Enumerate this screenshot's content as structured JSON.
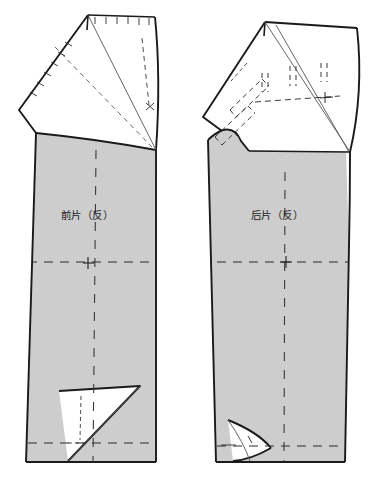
{
  "document": {
    "type": "garment-pattern-draft",
    "title": "",
    "background_color": "#ffffff",
    "canvas": {
      "width": 392,
      "height": 496
    }
  },
  "style": {
    "cut_line_color": "#1a1a1a",
    "fabric_fill": "#cdcdcd",
    "fold_fill": "#ffffff",
    "construction_line_color": "#3a3a3a",
    "thin_line_color": "#555555",
    "cut_line_width": 1.8,
    "thin_line_width": 0.8,
    "dash_pattern": "5,3",
    "short_dash_pattern": "3,2.5"
  },
  "pieces": [
    {
      "id": "front",
      "name": "front-pattern-piece",
      "label": "前片（反）",
      "label_x": 87,
      "label_y": 215,
      "description": "Trouser front panel, wrong side, with rotated top flap and bottom hem flap"
    },
    {
      "id": "back",
      "name": "back-pattern-piece",
      "label": "后片（反）",
      "label_x": 276,
      "label_y": 215,
      "description": "Trouser back panel, wrong side, with rotated top flap, pocket markings and bottom hem flap"
    }
  ],
  "markings": {
    "notch_label": "notch-tick",
    "grain_label": "grain-dash-line",
    "knee_label": "knee-cross-marker",
    "fold_label": "fold-flap",
    "pocket_label": "pocket-dashed-outline"
  },
  "geometry": {
    "front": {
      "body_shaded": "M 37,132 L 27,461 L 155,461 L 155,236 L 155,148 Z",
      "body_outline_left": "M 37,132 L 27,461",
      "hem_line": "M 27,461 L 155,461",
      "top_panel": "M 88,15 L 155,17 L 159,70 L 156,150 L 20,110 L 24,87 Z",
      "flap_edge": "M 88,15 L 20,110",
      "flap_lower": "M 20,110 L 37,132",
      "diag_seam": "M 88,15 L 155,148",
      "curve_waist": "M 37,132 Q 95,140 155,148",
      "bottom_flap": "M 60,390 L 140,386 L 68,461 Z",
      "bottom_diag": "M 140,386 L 68,461"
    },
    "back": {
      "body_shaded": "M 209,137 L 216,461 L 345,461 L 348,243 L 345,150 Z",
      "top_panel": "M 265,22 L 357,28 L 361,90 L 350,152 L 222,128 L 226,104 Z",
      "hem_line": "M 216,461 L 345,461",
      "bottom_flap": "M 228,420 L 270,447 L 232,461 Z"
    }
  },
  "accessibility": {
    "alt": "Technical sewing pattern diagram of trouser front and back panels with shaded fabric areas, folded white flaps, dashed construction lines and notch marks"
  }
}
